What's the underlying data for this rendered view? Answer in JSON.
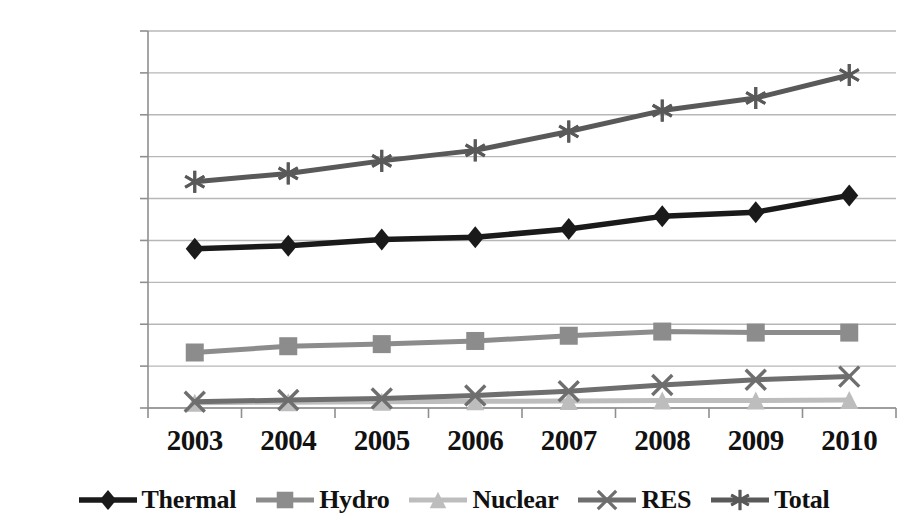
{
  "chart_data": {
    "type": "line",
    "title": "",
    "subtitle": "",
    "xlabel": "",
    "ylabel": "",
    "categories": [
      "2003",
      "2004",
      "2005",
      "2006",
      "2007",
      "2008",
      "2009",
      "2010"
    ],
    "ylim": [
      0,
      180000
    ],
    "ytick_values": [
      0,
      20000,
      40000,
      60000,
      80000,
      100000,
      120000,
      140000,
      160000,
      180000
    ],
    "ytick_labels": [
      "0",
      "20,000",
      "40,000",
      "60,000",
      "80,000",
      "100,000",
      "120,000",
      "140,000",
      "160,000",
      "180,000"
    ],
    "grid": true,
    "grid_axis": "y",
    "legend_position": "bottom",
    "series": [
      {
        "name": "Thermal",
        "marker": "diamond",
        "color": "#1a1a1a",
        "values": [
          76000,
          77500,
          80500,
          81500,
          85500,
          91500,
          93500,
          101500
        ]
      },
      {
        "name": "Hydro",
        "marker": "square",
        "color": "#8c8c8c",
        "values": [
          26500,
          29500,
          30500,
          32000,
          34500,
          36500,
          36000,
          36000
        ]
      },
      {
        "name": "Nuclear",
        "marker": "triangle",
        "color": "#bdbdbd",
        "values": [
          2500,
          2800,
          3000,
          3200,
          3400,
          3600,
          3600,
          3800
        ]
      },
      {
        "name": "RES",
        "marker": "x",
        "color": "#6e6e6e",
        "values": [
          3000,
          3800,
          4500,
          6000,
          8000,
          11000,
          13500,
          15000
        ]
      },
      {
        "name": "Total",
        "marker": "asterisk",
        "color": "#595959",
        "values": [
          108000,
          112000,
          118000,
          123000,
          132000,
          142000,
          148000,
          159000
        ]
      }
    ]
  },
  "style": {
    "grid_color": "#b7b7b7",
    "axis_color": "#8f8f8f",
    "text_color": "#111111",
    "background": "#ffffff"
  }
}
